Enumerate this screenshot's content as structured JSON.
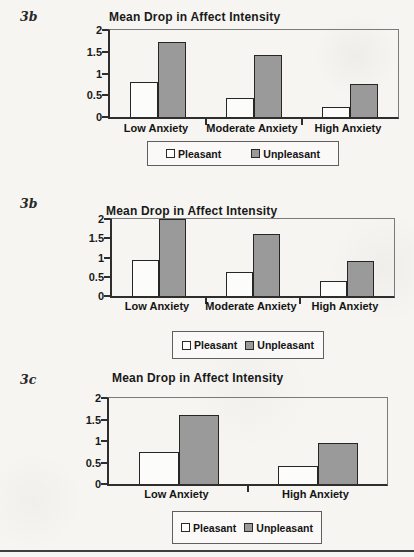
{
  "page": {
    "background_color": "#f6f5f1",
    "divider_color": "#3f3f3f"
  },
  "colors": {
    "pleasant_fill": "#ffffff",
    "unpleasant_fill": "#9a9a9a",
    "bar_border": "#262626",
    "axis": "#2e2e2e",
    "text": "#1a1a1a"
  },
  "chart_data": [
    {
      "type": "bar",
      "figure_label": "3b",
      "title": "Mean Drop in Affect Intensity",
      "categories": [
        "Low Anxiety",
        "Moderate Anxiety",
        "High Anxiety"
      ],
      "series": [
        {
          "name": "Pleasant",
          "values": [
            0.8,
            0.43,
            0.22
          ]
        },
        {
          "name": "Unpleasant",
          "values": [
            1.73,
            1.43,
            0.75
          ]
        }
      ],
      "xlabel": "",
      "ylabel": "",
      "ylim": [
        0,
        2
      ],
      "y_ticks": [
        "0",
        "0.5",
        "1",
        "1.5",
        "2"
      ],
      "grid": false,
      "legend_position": "bottom"
    },
    {
      "type": "bar",
      "figure_label": "3b",
      "title": "Mean Drop in Affect Intensity",
      "categories": [
        "Low Anxiety",
        "Moderate Anxiety",
        "High Anxiety"
      ],
      "series": [
        {
          "name": "Pleasant",
          "values": [
            0.93,
            0.62,
            0.4
          ]
        },
        {
          "name": "Unpleasant",
          "values": [
            2.0,
            1.6,
            0.9
          ]
        }
      ],
      "xlabel": "",
      "ylabel": "",
      "ylim": [
        0,
        2
      ],
      "y_ticks": [
        "0",
        "0.5",
        "1",
        "1.5",
        "2"
      ],
      "grid": false,
      "legend_position": "bottom"
    },
    {
      "type": "bar",
      "figure_label": "3c",
      "title": "Mean Drop in Affect Intensity",
      "categories": [
        "Low Anxiety",
        "High Anxiety"
      ],
      "series": [
        {
          "name": "Pleasant",
          "values": [
            0.75,
            0.42
          ]
        },
        {
          "name": "Unpleasant",
          "values": [
            1.6,
            0.95
          ]
        }
      ],
      "xlabel": "",
      "ylabel": "",
      "ylim": [
        0,
        2
      ],
      "y_ticks": [
        "0",
        "0.5",
        "1",
        "1.5",
        "2"
      ],
      "grid": false,
      "legend_position": "bottom"
    }
  ]
}
